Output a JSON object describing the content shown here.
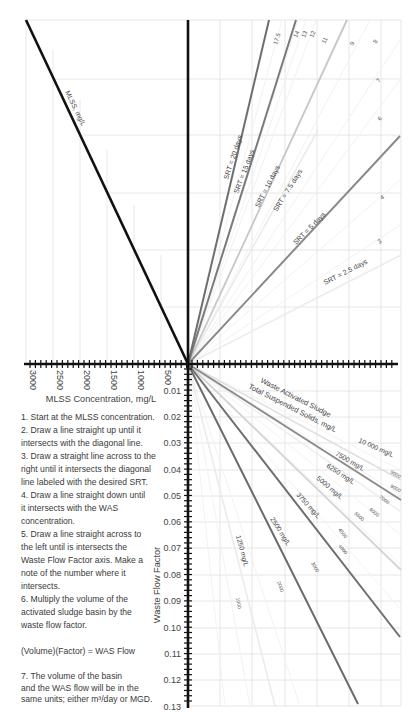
{
  "chart_data": {
    "type": "nomograph",
    "quadrants": {
      "upper_left": {
        "line_label": "MLSS, mg/L"
      },
      "upper_right": {
        "srt_lines": [
          {
            "label": "SRT = 20 days",
            "srt": 20,
            "color": "#6e6e6e"
          },
          {
            "label": "SRT = 15 days",
            "srt": 15,
            "color": "#7a7a7a"
          },
          {
            "label": "SRT = 10 days",
            "srt": 10,
            "color": "#c8c8c8"
          },
          {
            "label": "SRT = 7.5 days",
            "srt": 7.5,
            "color": "#e8e8e8"
          },
          {
            "label": "SRT = 5 days",
            "srt": 5,
            "color": "#8a8a8a"
          },
          {
            "label": "SRT = 2.5 days",
            "srt": 2.5,
            "color": "#ececec"
          }
        ],
        "minor_srt_labels": [
          "17.5",
          "14",
          "13",
          "12",
          "11",
          "9",
          "8",
          "7",
          "6",
          "4",
          "3"
        ]
      },
      "lower_right": {
        "title_line1": "Waste Activated Sludge",
        "title_line2": "Total Suspended Solids, mg/L",
        "was_lines": [
          {
            "label": "10 000 mg/L",
            "value": 10000,
            "color": "#8c8c8c"
          },
          {
            "label": "7500 mg/L",
            "value": 7500,
            "color": "#e0e0e0"
          },
          {
            "label": "6250 mg/L",
            "value": 6250,
            "color": "#efefef"
          },
          {
            "label": "5000 mg/L",
            "value": 5000,
            "color": "#d4d4d4"
          },
          {
            "label": "3750 mg/L",
            "value": 3750,
            "color": "#6e6e6e"
          },
          {
            "label": "2500 mg/L",
            "value": 2500,
            "color": "#6a6a6a"
          },
          {
            "label": "1250 mg/L",
            "value": 1250,
            "color": "#ececec"
          }
        ],
        "minor_was_labels": [
          "9000",
          "8000",
          "7000",
          "6000",
          "5500",
          "4500",
          "4000",
          "3000",
          "2000",
          "1000"
        ]
      }
    },
    "x_axis": {
      "label": "MLSS Concentration, mg/L",
      "ticks": [
        "3000",
        "2500",
        "2000",
        "1500",
        "1000",
        "500"
      ],
      "range": [
        0,
        3000
      ]
    },
    "y_axis": {
      "label": "Waste Flow Factor",
      "ticks": [
        "0.01",
        "0.02",
        "0.03",
        "0.04",
        "0.05",
        "0.06",
        "0.07",
        "0.08",
        "0.09",
        "0.10",
        "0.11",
        "0.12",
        "0.13"
      ],
      "range": [
        0,
        0.13
      ]
    },
    "grid": true
  },
  "instructions": {
    "step1": "1. Start at the MLSS concentration.",
    "step2a": "2. Draw a line straight up until it",
    "step2b": "intersects with the diagonal line.",
    "step3a": "3. Draw a straight line across to the",
    "step3b": "right until it intersects the diagonal",
    "step3c": "line labeled with the desired SRT.",
    "step4a": "4. Draw a line straight down until",
    "step4b": "it intersects with the WAS",
    "step4c": "concentration.",
    "step5a": "5. Draw a line straight across to",
    "step5b": "the left until is intersects the",
    "step5c": "Waste Flow Factor axis.  Make a",
    "step5d": "note of the number where it",
    "step5e": "intersects.",
    "step6a": "6. Multiply the volume of the",
    "step6b": "activated sludge basin by the",
    "step6c": "waste flow factor.",
    "formula": "(Volume)(Factor) = WAS Flow",
    "step7a": "7. The volume of the basin",
    "step7b": "and the WAS flow will be in the",
    "step7c": "same units; either m³/day or MGD."
  }
}
